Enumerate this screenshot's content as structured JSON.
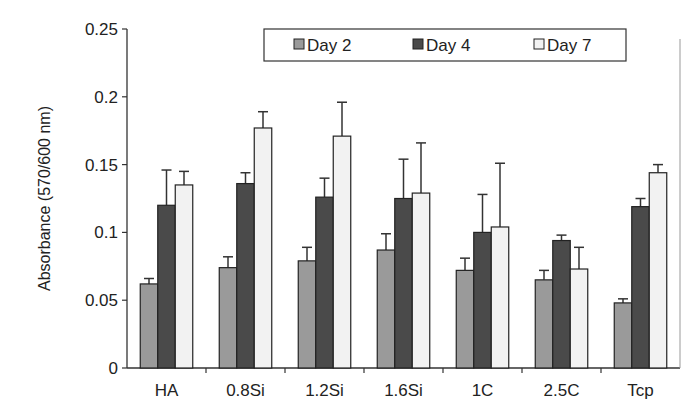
{
  "chart_data": {
    "type": "bar",
    "title": "",
    "xlabel": "",
    "ylabel": "Absorbance (570/600 nm)",
    "ylim": [
      0,
      0.25
    ],
    "yticks": [
      "0",
      "0.05",
      "0.1",
      "0.15",
      "0.2",
      "0.25"
    ],
    "grid": false,
    "legend_position": "top-right",
    "categories": [
      "HA",
      "0.8Si",
      "1.2Si",
      "1.6Si",
      "1C",
      "2.5C",
      "Tcp"
    ],
    "series": [
      {
        "name": "Day 2",
        "color": "#9a9a9a",
        "values": [
          0.062,
          0.074,
          0.079,
          0.087,
          0.072,
          0.065,
          0.048
        ],
        "error": [
          0.004,
          0.008,
          0.01,
          0.012,
          0.009,
          0.007,
          0.003
        ]
      },
      {
        "name": "Day 4",
        "color": "#4a4a4a",
        "values": [
          0.12,
          0.136,
          0.126,
          0.125,
          0.1,
          0.094,
          0.119
        ],
        "error": [
          0.026,
          0.008,
          0.014,
          0.029,
          0.028,
          0.004,
          0.006
        ]
      },
      {
        "name": "Day 7",
        "color": "#f2f2f2",
        "values": [
          0.135,
          0.177,
          0.171,
          0.129,
          0.104,
          0.073,
          0.144
        ],
        "error": [
          0.01,
          0.012,
          0.025,
          0.037,
          0.047,
          0.016,
          0.006
        ]
      }
    ]
  }
}
